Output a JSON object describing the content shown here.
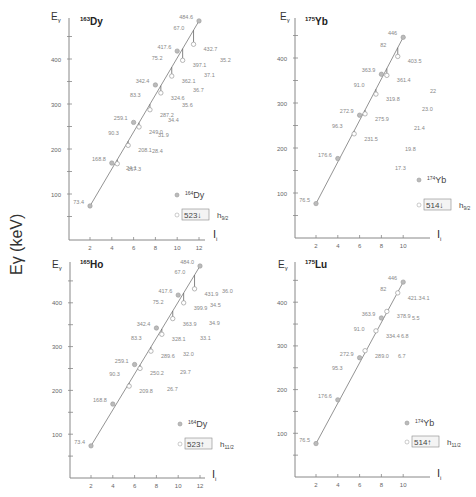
{
  "global_ylabel": "Eγ (keV)",
  "chart_data": [
    {
      "type": "line",
      "panel": "top-left",
      "title_mass": "163",
      "title_element": "Dy",
      "xlabel": "I_i",
      "ylabel": "Eγ",
      "xticks": [
        2,
        4,
        6,
        8,
        10,
        12
      ],
      "yticks": [
        100,
        200,
        300,
        400
      ],
      "xlim": [
        0,
        12.5
      ],
      "ylim": [
        0,
        490
      ],
      "line_series": {
        "name": "164Dy (filled)",
        "x": [
          2,
          4,
          6,
          8,
          10,
          12
        ],
        "y": [
          73.4,
          168.8,
          259.1,
          342.4,
          417.6,
          484.6
        ],
        "labels": [
          "73.4",
          "168.8",
          "259.1",
          "342.4",
          "417.6",
          "484.6"
        ]
      },
      "open_series": {
        "name": "523↓ h9/2 (open)",
        "x": [
          4.5,
          5.5,
          6.5,
          7.5,
          8.5,
          9.5,
          10.5,
          11.5
        ],
        "y": [
          167.3,
          208.1,
          249.0,
          287.2,
          324.6,
          362.1,
          397.1,
          432.7
        ],
        "labels": [
          "167.3",
          "208.1",
          "249.0",
          "287.2",
          "324.6",
          "362.1",
          "397.1",
          "432.7"
        ]
      },
      "gap_labels": [
        {
          "x": 5.2,
          "y": 232,
          "text": "90.3"
        },
        {
          "x": 7.2,
          "y": 315,
          "text": "83.3"
        },
        {
          "x": 9.2,
          "y": 398,
          "text": "75.2"
        },
        {
          "x": 11.2,
          "y": 465,
          "text": "67.0"
        }
      ],
      "differences": [
        "24.1",
        "28.4",
        "31.9",
        "34.4",
        "35.6",
        "36.7",
        "37.1",
        "35.2"
      ],
      "legend": {
        "filled": "164Dy",
        "filled_mass": "164",
        "filled_el": "Dy",
        "box": "523↓",
        "orbital": "h",
        "orbital_sub": "9/2"
      }
    },
    {
      "type": "line",
      "panel": "top-right",
      "title_mass": "175",
      "title_element": "Yb",
      "xlabel": "I_i",
      "ylabel": "Eγ",
      "xticks": [
        2,
        4,
        6,
        8,
        10
      ],
      "yticks": [
        100,
        200,
        300,
        400
      ],
      "xlim": [
        0,
        12.5
      ],
      "ylim": [
        0,
        490
      ],
      "line_series": {
        "name": "174Yb (filled)",
        "x": [
          2,
          4,
          6,
          8,
          10
        ],
        "y": [
          76.5,
          176.6,
          272.9,
          363.9,
          446
        ],
        "labels": [
          "76.5",
          "176.6",
          "272.9",
          "363.9",
          "446"
        ]
      },
      "open_series": {
        "name": "514↓ h9/2 (open)",
        "x": [
          5.5,
          6.5,
          7.5,
          8.5,
          9.5
        ],
        "y": [
          231.5,
          275.9,
          319.8,
          361.4,
          403.5
        ],
        "labels": [
          "231.5",
          "275.9",
          "319.8",
          "361.4",
          "403.5"
        ]
      },
      "gap_labels": [
        {
          "x": 5.0,
          "y": 245,
          "text": "96.3"
        },
        {
          "x": 7.0,
          "y": 335,
          "text": "91.0"
        },
        {
          "x": 9.0,
          "y": 425,
          "text": "82"
        }
      ],
      "differences": [
        "17.3",
        "19.8",
        "21.4",
        "23.0",
        "22"
      ],
      "legend": {
        "filled": "174Yb",
        "filled_mass": "174",
        "filled_el": "Yb",
        "box": "514↓",
        "orbital": "h",
        "orbital_sub": "9/2"
      }
    },
    {
      "type": "line",
      "panel": "bottom-left",
      "title_mass": "165",
      "title_element": "Ho",
      "xlabel": "I_i",
      "ylabel": "Eγ",
      "xticks": [
        2,
        4,
        6,
        8,
        10,
        12
      ],
      "yticks": [
        100,
        200,
        300,
        400
      ],
      "xlim": [
        0,
        12.5
      ],
      "ylim": [
        0,
        490
      ],
      "line_series": {
        "name": "164Dy (filled)",
        "x": [
          2,
          4,
          6,
          8,
          10,
          12
        ],
        "y": [
          73.4,
          168.8,
          259.1,
          342.4,
          417.6,
          484.0
        ],
        "labels": [
          "73.4",
          "168.8",
          "259.1",
          "342.4",
          "417.6",
          "484.0"
        ]
      },
      "open_series": {
        "name": "523↑ h11/2 (open)",
        "x": [
          5.5,
          6.5,
          7.5,
          8.5,
          9.5,
          10.5,
          11.5
        ],
        "y": [
          209.8,
          250.2,
          289.6,
          328.1,
          363.9,
          399.9,
          431.9
        ],
        "labels": [
          "209.8",
          "250.2",
          "289.6",
          "328.1",
          "363.9",
          "399.9",
          "431.9"
        ]
      },
      "gap_labels": [
        {
          "x": 5.2,
          "y": 232,
          "text": "90.3"
        },
        {
          "x": 7.2,
          "y": 315,
          "text": "83.3"
        },
        {
          "x": 9.2,
          "y": 398,
          "text": "75.2"
        },
        {
          "x": 11.2,
          "y": 465,
          "text": "67.0"
        }
      ],
      "differences": [
        "26.7",
        "29.7",
        "32.0",
        "33.1",
        "34.9",
        "34.5",
        "36.0"
      ],
      "legend": {
        "filled": "164Dy",
        "filled_mass": "164",
        "filled_el": "Dy",
        "box": "523↑",
        "orbital": "h",
        "orbital_sub": "11/2"
      }
    },
    {
      "type": "line",
      "panel": "bottom-right",
      "title_mass": "175",
      "title_element": "Lu",
      "xlabel": "I_i",
      "ylabel": "Eγ",
      "xticks": [
        2,
        4,
        6,
        8,
        10
      ],
      "yticks": [
        100,
        200,
        300,
        400
      ],
      "xlim": [
        0,
        12.5
      ],
      "ylim": [
        0,
        490
      ],
      "line_series": {
        "name": "174Yb (filled)",
        "x": [
          2,
          4,
          6,
          8,
          10
        ],
        "y": [
          76.5,
          176.6,
          272.9,
          363.9,
          446
        ],
        "labels": [
          "76.5",
          "176.6",
          "272.9",
          "363.9",
          "446"
        ]
      },
      "open_series": {
        "name": "514↑ h11/2 (open)",
        "x": [
          6.5,
          7.5,
          8.5,
          9.5
        ],
        "y": [
          289.0,
          334.4,
          378.9,
          421.3
        ],
        "labels": [
          "289.0",
          "334.4",
          "378.9",
          "421.3"
        ]
      },
      "gap_labels": [
        {
          "x": 5.0,
          "y": 245,
          "text": "95.3"
        },
        {
          "x": 7.0,
          "y": 335,
          "text": "91.0"
        },
        {
          "x": 9.0,
          "y": 425,
          "text": "82"
        }
      ],
      "differences": [
        "6.7",
        "6.8",
        "5.5",
        "4.1"
      ],
      "legend": {
        "filled": "174Yb",
        "filled_mass": "174",
        "filled_el": "Yb",
        "box": "514↑",
        "orbital": "h",
        "orbital_sub": "11/2"
      }
    }
  ],
  "layout": {
    "panels": [
      {
        "ax_x": 69,
        "ax_y": 240,
        "y_top": 18,
        "x_end": 205,
        "x0": 68.2,
        "xs": 10.9,
        "y0": 239,
        "ys": 0.45,
        "title_pos": [
          80,
          25
        ],
        "ylab_pos": [
          51,
          20
        ],
        "xlab_pos": [
          213,
          238
        ],
        "diff_pos": [
          [
            126,
            170
          ],
          [
            152,
            153
          ],
          [
            158,
            137
          ],
          [
            168,
            122
          ],
          [
            182,
            107
          ],
          [
            193,
            92
          ],
          [
            204,
            77
          ],
          [
            220,
            62
          ]
        ],
        "legend_filled": [
          177,
          195
        ],
        "legend_open": [
          177,
          215
        ],
        "open_label_dx": 10,
        "open_label_dy": 4
      },
      {
        "ax_x": 295,
        "ax_y": 238,
        "y_top": 18,
        "x_end": 430,
        "x0": 294.2,
        "xs": 10.9,
        "y0": 238,
        "ys": 0.45,
        "title_pos": [
          305,
          25
        ],
        "ylab_pos": [
          280,
          20
        ],
        "xlab_pos": [
          437,
          238
        ],
        "diff_pos": [
          [
            395,
            170
          ],
          [
            405,
            151
          ],
          [
            414,
            130
          ],
          [
            422,
            111
          ],
          [
            430,
            93
          ]
        ],
        "legend_filled": [
          419,
          180
        ],
        "legend_open": [
          419,
          205
        ],
        "open_label_dx": 10,
        "open_label_dy": 4
      },
      {
        "ax_x": 70,
        "ax_y": 478,
        "y_top": 262,
        "x_end": 205,
        "x0": 69.2,
        "xs": 10.9,
        "y0": 478,
        "ys": 0.438,
        "title_pos": [
          80,
          268
        ],
        "ylab_pos": [
          52,
          268
        ],
        "xlab_pos": [
          212,
          478
        ],
        "diff_pos": [
          [
            167,
            391
          ],
          [
            180,
            374
          ],
          [
            183,
            356
          ],
          [
            200,
            340
          ],
          [
            209,
            325
          ],
          [
            210,
            307
          ],
          [
            222,
            293
          ]
        ],
        "legend_filled": [
          180,
          424
        ],
        "legend_open": [
          180,
          444
        ],
        "open_label_dx": 10,
        "open_label_dy": 4
      },
      {
        "ax_x": 295,
        "ax_y": 477,
        "y_top": 262,
        "x_end": 430,
        "x0": 294.2,
        "xs": 10.9,
        "y0": 477,
        "ys": 0.437,
        "title_pos": [
          305,
          268
        ],
        "ylab_pos": [
          278,
          268
        ],
        "xlab_pos": [
          437,
          477
        ],
        "diff_pos": [
          [
            398,
            358
          ],
          [
            401,
            338
          ],
          [
            412,
            320
          ],
          [
            422,
            300
          ]
        ],
        "legend_filled": [
          407,
          423
        ],
        "legend_open": [
          407,
          442
        ],
        "open_label_dx": 10,
        "open_label_dy": 4
      }
    ]
  }
}
